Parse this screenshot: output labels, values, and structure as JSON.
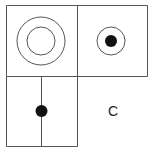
{
  "diagram": {
    "cells": [
      {
        "position": "top-left",
        "content": "two concentric circles"
      },
      {
        "position": "top-right",
        "content": "circle with filled dot in center"
      },
      {
        "position": "bottom-left",
        "content": "vertical line with filled dot"
      },
      {
        "position": "bottom-right",
        "content": "label",
        "label": "C"
      }
    ],
    "answer_label": "C",
    "colors": {
      "stroke": "#555555",
      "fill": "#111111",
      "background": "#ffffff"
    }
  }
}
